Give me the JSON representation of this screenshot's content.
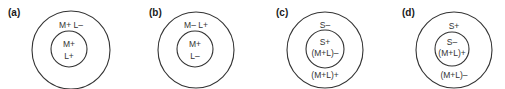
{
  "diagram": {
    "type": "concentric-circle receptive field schematics",
    "panels": [
      {
        "label": "(a)",
        "surround_text": [
          "M+ L–"
        ],
        "center_text": [
          "M+",
          "L+"
        ],
        "bottom_text": ""
      },
      {
        "label": "(b)",
        "surround_text": [
          "M– L+"
        ],
        "center_text": [
          "M+",
          "L–"
        ],
        "bottom_text": ""
      },
      {
        "label": "(c)",
        "surround_text": [
          "S–"
        ],
        "center_text": [
          "S+",
          "(M+L)–"
        ],
        "bottom_text": "(M+L)+"
      },
      {
        "label": "(d)",
        "surround_text": [
          "S+"
        ],
        "center_text": [
          "S–",
          "(M+L)+"
        ],
        "bottom_text": "(M+L)–"
      }
    ],
    "colors": {
      "stroke": "#333333",
      "text": "#333333",
      "background": "#ffffff"
    }
  }
}
